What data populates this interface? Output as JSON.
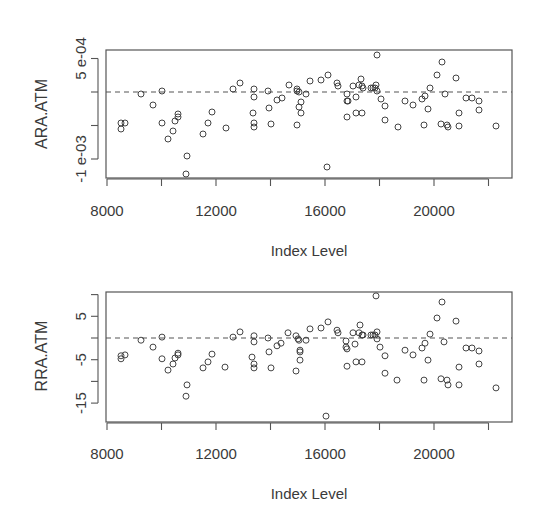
{
  "chart_data": [
    {
      "type": "scatter",
      "title": "",
      "xlabel": "Index Level",
      "ylabel": "ARA.ATM",
      "xlim": [
        8000,
        23000
      ],
      "ylim": [
        -0.00134,
        0.00062
      ],
      "x_ticks": [
        8000,
        10000,
        12000,
        14000,
        16000,
        18000,
        20000,
        22000
      ],
      "x_tick_labels": [
        "8000",
        "",
        "12000",
        "",
        "16000",
        "",
        "20000",
        ""
      ],
      "y_ticks": [
        0.0005,
        0,
        -0.0005,
        -0.001
      ],
      "y_tick_labels": [
        "5 e-04",
        "",
        "",
        "-1 e-03"
      ],
      "reference_line": {
        "y": 0,
        "style": "dashed"
      },
      "grid": false,
      "marker": "open-circle",
      "x": [
        8514,
        8661,
        8514,
        9248,
        9688,
        10018,
        10018,
        10239,
        10422,
        10496,
        10606,
        10606,
        10936,
        10899,
        11523,
        11707,
        11854,
        12367,
        12624,
        12881,
        13395,
        13395,
        13358,
        13395,
        13395,
        13909,
        13945,
        14019,
        14239,
        14422,
        14679,
        14973,
        14973,
        15046,
        15120,
        15046,
        15120,
        14973,
        15303,
        15450,
        15853,
        16110,
        16073,
        16440,
        16477,
        16807,
        16807,
        16844,
        16807,
        17028,
        17138,
        17248,
        17321,
        17358,
        17138,
        17358,
        17395,
        17688,
        17762,
        17836,
        17872,
        17909,
        17909,
        18056,
        18202,
        18202,
        18679,
        18936,
        19230,
        19560,
        19671,
        19854,
        19781,
        19634,
        20111,
        20294,
        20404,
        20257,
        20477,
        20514,
        20808,
        20918,
        20918,
        21175,
        21395,
        21652,
        21652,
        22275
      ],
      "y": [
        -0.000463,
        -0.000463,
        -0.000552,
        -3e-05,
        -0.000194,
        1.5e-05,
        -0.000463,
        -0.000701,
        -0.000582,
        -0.000433,
        -0.000373,
        -0.000328,
        -0.000955,
        -0.001224,
        -0.000627,
        -0.000463,
        -0.000299,
        -0.000537,
        4.5e-05,
        0.000134,
        4.5e-05,
        -7.5e-05,
        -0.000313,
        -0.000463,
        -0.000522,
        1.5e-05,
        -0.000239,
        -0.000478,
        -0.000119,
        -9e-05,
        0.000104,
        4.5e-05,
        1.5e-05,
        0,
        -0.000149,
        -0.000224,
        -0.000313,
        -0.000493,
        -3e-05,
        0.000164,
        0.000179,
        0.000254,
        -0.001119,
        0.000134,
        9e-05,
        -3e-05,
        -0.000134,
        -0.000134,
        -0.000373,
        9e-05,
        -7.5e-05,
        0.000104,
        0.000194,
        9e-05,
        -0.000313,
        -0.000313,
        6e-05,
        6e-05,
        6e-05,
        6e-05,
        0.000104,
        0.000552,
        1.5e-05,
        -0.000104,
        -0.000209,
        -0.000418,
        -0.000522,
        -0.000134,
        -0.000194,
        -0.000104,
        -6e-05,
        6e-05,
        -0.000254,
        -0.000493,
        0.000254,
        0.000448,
        -3e-05,
        -0.000478,
        -0.000493,
        -0.000522,
        0.000209,
        -0.000313,
        -0.000507,
        -9e-05,
        -9e-05,
        -0.000134,
        -0.000269,
        -0.000507
      ]
    },
    {
      "type": "scatter",
      "title": "",
      "xlabel": "Index Level",
      "ylabel": "RRA.ATM",
      "xlim": [
        8000,
        23000
      ],
      "ylim": [
        -19.4,
        10.6
      ],
      "x_ticks": [
        8000,
        10000,
        12000,
        14000,
        16000,
        18000,
        20000,
        22000
      ],
      "x_tick_labels": [
        "8000",
        "",
        "12000",
        "",
        "16000",
        "",
        "20000",
        ""
      ],
      "y_ticks": [
        10,
        5,
        0,
        -5,
        -10,
        -15
      ],
      "y_tick_labels": [
        "",
        "5",
        "",
        "-5",
        "",
        "-15"
      ],
      "reference_line": {
        "y": 0,
        "style": "dashed"
      },
      "grid": false,
      "marker": "open-circle",
      "x": [
        8514,
        8661,
        8514,
        9248,
        9688,
        10018,
        10018,
        10239,
        10422,
        10496,
        10606,
        10606,
        10936,
        10899,
        11523,
        11707,
        11854,
        12330,
        12624,
        12881,
        13395,
        13395,
        13321,
        13395,
        13395,
        13909,
        13945,
        14019,
        14239,
        14385,
        14642,
        14936,
        15010,
        15046,
        15083,
        15083,
        15083,
        14936,
        15303,
        15450,
        15853,
        16110,
        16037,
        16440,
        16477,
        16770,
        16770,
        16807,
        16807,
        17028,
        17101,
        17248,
        17285,
        17358,
        17138,
        17358,
        17395,
        17688,
        17762,
        17836,
        17909,
        17872,
        17909,
        18019,
        18202,
        18202,
        18642,
        18936,
        19230,
        19560,
        19671,
        19854,
        19781,
        19634,
        20111,
        20294,
        20367,
        20257,
        20477,
        20514,
        20808,
        20918,
        20918,
        21175,
        21395,
        21652,
        21652,
        22275
      ],
      "y": [
        -4.1,
        -3.9,
        -4.8,
        -0.5,
        -2.1,
        0.2,
        -4.8,
        -7.4,
        -6.0,
        -4.6,
        -3.9,
        -3.5,
        -10.8,
        -13.4,
        -6.9,
        -5.5,
        -3.7,
        -6.7,
        0.2,
        1.4,
        0.5,
        -0.9,
        -4.4,
        -6.0,
        -6.9,
        0.0,
        -3.2,
        -6.9,
        -1.8,
        -1.2,
        1.2,
        0.5,
        -0.2,
        -0.5,
        -2.8,
        -3.2,
        -5.1,
        -7.6,
        -0.5,
        2.1,
        2.3,
        3.7,
        -18.0,
        1.8,
        1.2,
        -0.7,
        -2.1,
        -2.5,
        -6.5,
        1.2,
        -1.4,
        1.2,
        3.0,
        0.7,
        -5.5,
        -5.5,
        0.7,
        0.7,
        0.7,
        0.7,
        1.4,
        9.7,
        -0.2,
        -2.1,
        -4.1,
        -8.1,
        -9.7,
        -2.8,
        -3.9,
        -2.3,
        -1.2,
        0.9,
        -5.1,
        -9.7,
        4.6,
        8.3,
        -0.9,
        -9.4,
        -9.7,
        -10.8,
        3.9,
        -6.7,
        -10.8,
        -2.3,
        -2.3,
        -3.0,
        -6.0,
        -11.5
      ]
    }
  ],
  "panels": [
    {
      "frame": {
        "left": 106,
        "top": 50,
        "right": 512,
        "bottom": 178
      },
      "y_zero_px": 92,
      "y_px_per_unit": 67000,
      "axis_y_px": 179,
      "tick_label_y_px": 216,
      "xlabel_y_px": 256,
      "ylabel_x_px": 42,
      "ylabel_y_px": 114
    },
    {
      "frame": {
        "left": 106,
        "top": 292,
        "right": 512,
        "bottom": 422
      },
      "y_zero_px": 338,
      "y_px_per_unit": 4.34,
      "axis_y_px": 423,
      "tick_label_y_px": 459,
      "xlabel_y_px": 499,
      "ylabel_x_px": 42,
      "ylabel_y_px": 356
    }
  ],
  "style": {
    "ink": "#3a3a3a",
    "frame": "#555555",
    "point": "#444444",
    "x_origin_value": 8000,
    "x_origin_px": 107,
    "x_px_per_unit": 0.02725
  }
}
